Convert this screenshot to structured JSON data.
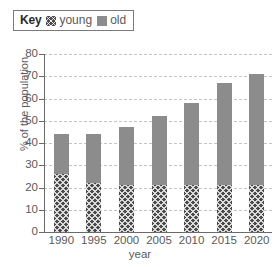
{
  "legend": {
    "title": "Key",
    "entries": [
      {
        "label": "young",
        "swatch": "young-hatched-swatch",
        "color": "#4a4a4a"
      },
      {
        "label": "old",
        "swatch": "old-solid-swatch",
        "color": "#8c8c8c"
      }
    ]
  },
  "chart_data": {
    "type": "bar",
    "title": "",
    "subtitle": "",
    "xlabel": "year",
    "ylabel": "% of the population",
    "categories": [
      "1990",
      "1995",
      "2000",
      "2005",
      "2010",
      "2015",
      "2020"
    ],
    "series": [
      {
        "name": "young",
        "values": [
          26,
          22,
          21,
          21,
          21,
          21,
          21
        ]
      },
      {
        "name": "old",
        "values": [
          18,
          22,
          26,
          31,
          37,
          46,
          50
        ]
      }
    ],
    "totals": [
      44,
      44,
      47,
      52,
      58,
      67,
      71
    ],
    "stacked": true,
    "ylim": [
      0,
      80
    ],
    "yticks": [
      0,
      10,
      20,
      30,
      40,
      50,
      60,
      70,
      80
    ],
    "ytick_labels": [
      "0",
      "10",
      "20",
      "30",
      "40",
      "50",
      "60",
      "70",
      "80"
    ],
    "grid": true,
    "grid_style": "dashed-horizontal",
    "legend_position": "top-left"
  }
}
